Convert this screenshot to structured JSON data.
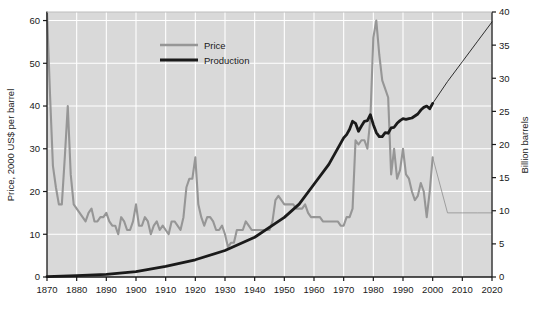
{
  "chart_data": {
    "type": "line",
    "title": "",
    "xlabel": "",
    "ylabel": "Price, 2000 US$ per barrel",
    "y2label": "Billion barrels",
    "xlim": [
      1870,
      2020
    ],
    "ylim": [
      0,
      62
    ],
    "y2lim": [
      0,
      40
    ],
    "xticks": [
      1870,
      1880,
      1890,
      1900,
      1910,
      1920,
      1930,
      1940,
      1950,
      1960,
      1970,
      1980,
      1990,
      2000,
      2010,
      2020
    ],
    "xticklabels": [
      "1870",
      "1880",
      "1890",
      "1900",
      "1910",
      "1920",
      "1930",
      "1940",
      "1950",
      "1960",
      "1970",
      "1980",
      "1990",
      "2000",
      "2010",
      "2020"
    ],
    "yticks": [
      0,
      10,
      20,
      30,
      40,
      50,
      60
    ],
    "yticklabels": [
      "0",
      "10",
      "20",
      "30",
      "40",
      "50",
      "60"
    ],
    "y2ticks": [
      0,
      5,
      10,
      15,
      20,
      25,
      30,
      35,
      40
    ],
    "y2ticklabels": [
      "0",
      "5",
      "10",
      "15",
      "20",
      "25",
      "30",
      "35",
      "40"
    ],
    "grid": true,
    "grid_color": "#ffffff",
    "plot_bgcolor": "#d9d9d9",
    "legend_position": "top-center",
    "legend": [
      {
        "name": "Price",
        "color": "#969696",
        "width": 2.2
      },
      {
        "name": "Production",
        "color": "#1a1a1a",
        "width": 2.6
      }
    ],
    "series": [
      {
        "name": "Price",
        "axis": "left",
        "color": "#969696",
        "units": "2000 US$ per barrel",
        "historical_end_year": 2000,
        "x": [
          1870,
          1871,
          1872,
          1873,
          1874,
          1875,
          1876,
          1877,
          1878,
          1879,
          1880,
          1881,
          1882,
          1883,
          1884,
          1885,
          1886,
          1887,
          1888,
          1889,
          1890,
          1891,
          1892,
          1893,
          1894,
          1895,
          1896,
          1897,
          1898,
          1899,
          1900,
          1901,
          1902,
          1903,
          1904,
          1905,
          1906,
          1907,
          1908,
          1909,
          1910,
          1911,
          1912,
          1913,
          1914,
          1915,
          1916,
          1917,
          1918,
          1919,
          1920,
          1921,
          1922,
          1923,
          1924,
          1925,
          1926,
          1927,
          1928,
          1929,
          1930,
          1931,
          1932,
          1933,
          1934,
          1935,
          1936,
          1937,
          1938,
          1939,
          1940,
          1941,
          1942,
          1943,
          1944,
          1945,
          1946,
          1947,
          1948,
          1949,
          1950,
          1951,
          1952,
          1953,
          1954,
          1955,
          1956,
          1957,
          1958,
          1959,
          1960,
          1961,
          1962,
          1963,
          1964,
          1965,
          1966,
          1967,
          1968,
          1969,
          1970,
          1971,
          1972,
          1973,
          1974,
          1975,
          1976,
          1977,
          1978,
          1979,
          1980,
          1981,
          1982,
          1983,
          1984,
          1985,
          1986,
          1987,
          1988,
          1989,
          1990,
          1991,
          1992,
          1993,
          1994,
          1995,
          1996,
          1997,
          1998,
          1999,
          2000,
          2005,
          2010,
          2015,
          2020
        ],
        "y": [
          62,
          43,
          26,
          21,
          17,
          17,
          28,
          40,
          24,
          17,
          16,
          15,
          14,
          13,
          15,
          16,
          13,
          13,
          14,
          14,
          15,
          13,
          12,
          12,
          10,
          14,
          13,
          11,
          11,
          13,
          17,
          12,
          12,
          14,
          13,
          10,
          12,
          13,
          11,
          12,
          11,
          10,
          13,
          13,
          12,
          11,
          14,
          21,
          23,
          23,
          28,
          17,
          14,
          12,
          14,
          14,
          13,
          11,
          11,
          12,
          10,
          7,
          8,
          8,
          11,
          11,
          11,
          13,
          12,
          11,
          11,
          11,
          11,
          11,
          11,
          11,
          13,
          18,
          19,
          18,
          17,
          17,
          17,
          17,
          16,
          16,
          16,
          17,
          15,
          14,
          14,
          14,
          14,
          13,
          13,
          13,
          13,
          13,
          13,
          12,
          12,
          14,
          14,
          16,
          32,
          31,
          32,
          32,
          30,
          37,
          56,
          60,
          52,
          46,
          44,
          42,
          24,
          30,
          23,
          25,
          30,
          24,
          23,
          20,
          18,
          19,
          22,
          20,
          14,
          20,
          28,
          15,
          15,
          15,
          15
        ],
        "projection_note": "After 2000 the line is drawn thin (scenario/projection) and stays near 15"
      },
      {
        "name": "Production",
        "axis": "right",
        "color": "#1a1a1a",
        "units": "Billion barrels per year",
        "historical_end_year": 2000,
        "x": [
          1870,
          1880,
          1890,
          1900,
          1910,
          1920,
          1930,
          1940,
          1950,
          1955,
          1960,
          1965,
          1970,
          1971,
          1972,
          1973,
          1974,
          1975,
          1976,
          1977,
          1978,
          1979,
          1980,
          1981,
          1982,
          1983,
          1984,
          1985,
          1986,
          1987,
          1988,
          1989,
          1990,
          1991,
          1992,
          1993,
          1994,
          1995,
          1996,
          1997,
          1998,
          1999,
          2000,
          2005,
          2010,
          2015,
          2020
        ],
        "y": [
          0.05,
          0.2,
          0.4,
          0.8,
          1.6,
          2.6,
          4.0,
          6.0,
          9.0,
          11.0,
          14.0,
          17.0,
          21.0,
          21.5,
          22.3,
          23.5,
          23.2,
          22.0,
          22.8,
          23.5,
          23.6,
          24.5,
          23.0,
          21.8,
          21.2,
          21.2,
          21.8,
          21.7,
          22.5,
          22.6,
          23.2,
          23.6,
          23.9,
          23.8,
          23.9,
          24.0,
          24.3,
          24.6,
          25.2,
          25.6,
          25.8,
          25.4,
          26.2,
          29.5,
          32.5,
          35.5,
          38.5
        ],
        "projection_note": "After 2000 the line is drawn thin (scenario/projection) rising to about 38.5 by 2020"
      }
    ],
    "annotations": [
      {
        "text": "1870 price spike near 62 US$/barrel",
        "year": 1870
      },
      {
        "text": "1980 price peak near 60 US$/barrel",
        "year": 1980
      },
      {
        "text": "Production and price lines become thin projections after 2000",
        "year": 2000
      }
    ]
  },
  "axes": {
    "left_title": "Price, 2000 US$ per barrel",
    "right_title": "Billion barrels"
  },
  "legend": {
    "price_label": "Price",
    "production_label": "Production"
  }
}
